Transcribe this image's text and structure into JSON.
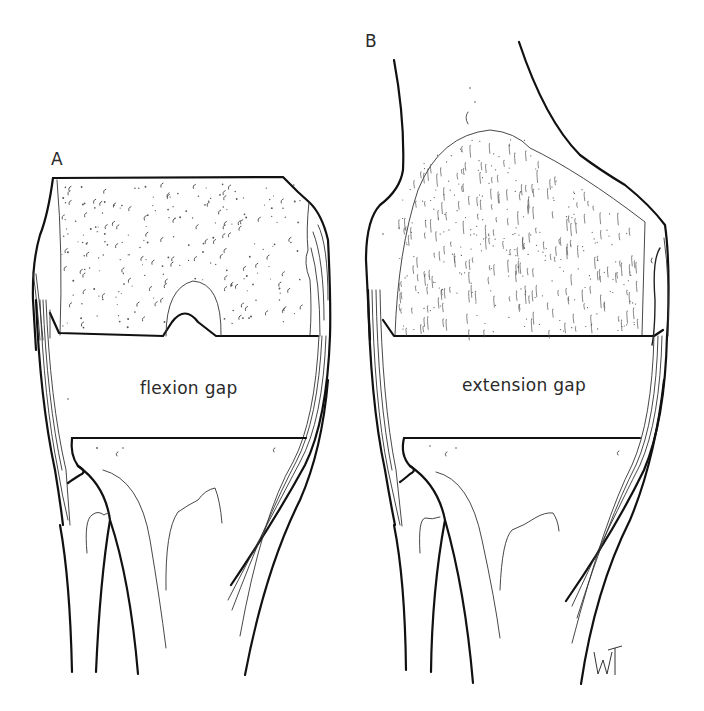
{
  "figure": {
    "panels": [
      {
        "id": "A",
        "label": "A",
        "gap_label": "flexion gap",
        "bone_texture": "stippled"
      },
      {
        "id": "B",
        "label": "B",
        "gap_label": "extension gap",
        "bone_texture": "hatched"
      }
    ],
    "signature": "WT",
    "colors": {
      "line": "#111111",
      "background": "#ffffff",
      "text": "#2a2a2a"
    }
  }
}
